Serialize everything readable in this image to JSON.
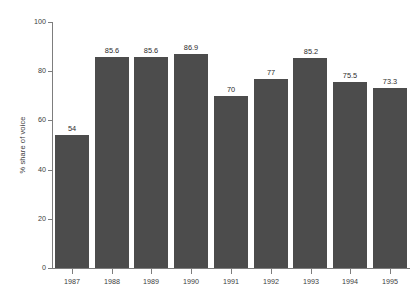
{
  "chart_data": {
    "type": "bar",
    "title": "",
    "subtitle": "",
    "xlabel": "",
    "ylabel": "% share of voice",
    "categories": [
      "1987",
      "1988",
      "1989",
      "1990",
      "1991",
      "1992",
      "1993",
      "1994",
      "1995"
    ],
    "values": [
      54,
      85.6,
      85.6,
      86.9,
      70,
      77,
      85.2,
      75.5,
      73.3
    ],
    "data_labels": [
      "54",
      "85.6",
      "85.6",
      "86.9",
      "70",
      "77",
      "85.2",
      "75.5",
      "73.3"
    ],
    "ylim": [
      0,
      100
    ],
    "y_ticks": [
      0,
      20,
      40,
      60,
      80,
      100
    ],
    "y_tick_labels": [
      "0",
      "20",
      "40",
      "60",
      "80",
      "100"
    ],
    "grid": false,
    "legend": null,
    "legend_position": "none",
    "bar_color": "#4c4c4c",
    "background_color": "#ffffff",
    "axis_color": "#7d7d7d",
    "text_color": "#3d3d3d"
  }
}
